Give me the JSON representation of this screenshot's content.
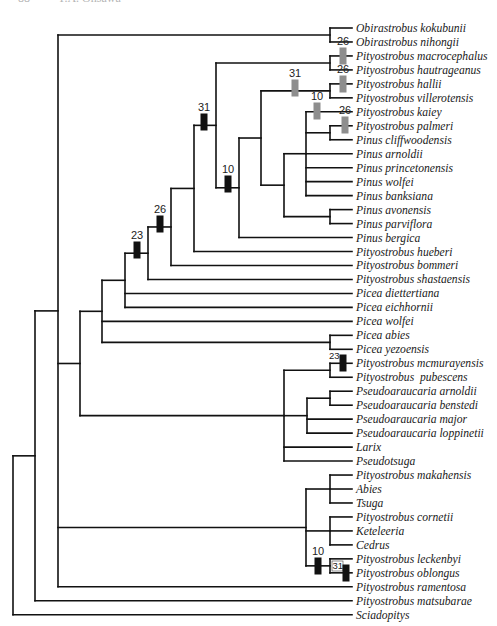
{
  "header": {
    "page_number": "88",
    "author": "T.A. Ohsawa"
  },
  "colors": {
    "line": "#111111",
    "black_bar": "#111111",
    "gray_bar": "#8e8e8e",
    "label": "#1a1a1a"
  },
  "tree": {
    "row_start_y": 28,
    "row_step": 13.97,
    "leaf_x": 352,
    "label_x": 356,
    "leaves": [
      "Obirastrobus kokubunii",
      "Obirastrobus nihongii",
      "Pityostrobus macrocephalus",
      "Pityostrobus hautrageanus",
      "Pityostrobus hallii",
      "Pityostrobus villerotensis",
      "Pityostrobus kaiey",
      "Pityostrobus palmeri",
      "Pinus cliffwoodensis",
      "Pinus arnoldii",
      "Pinus princetonensis",
      "Pinus wolfei",
      "Pinus banksiana",
      "Pinus avonensis",
      "Pinus parviflora",
      "Pinus bergica",
      "Pityostrobus hueberi",
      "Pityostrobus bommeri",
      "Pityostrobus shastaensis",
      "Picea diettertiana",
      "Picea eichhornii",
      "Picea wolfei",
      "Picea abies",
      "Picea yezoensis",
      "Pityostrobus mcmurayensis",
      "Pityostrobus  pubescens",
      "Pseudoaraucaria arnoldii",
      "Pseudoaraucaria benstedi",
      "Pseudoaraucaria major",
      "Pseudoaraucaria loppinetii",
      "Larix",
      "Pseudotsuga",
      "Pityostrobus makahensis",
      "Abies",
      "Tsuga",
      "Pityostrobus cornetii",
      "Keteleeria",
      "Cedrus",
      "Pityostrobus leckenbyi",
      "Pityostrobus oblongus",
      "Pityostrobus ramentosa",
      "Pityostrobus matsubarae",
      "Sciadopitys"
    ],
    "nodes": [
      {
        "id": "root",
        "x": 13,
        "children": [
          "n35",
          "L42"
        ]
      },
      {
        "id": "n35",
        "x": 35,
        "children": [
          "n58",
          "L41"
        ]
      },
      {
        "id": "n58",
        "x": 58,
        "children": [
          "nObi",
          "n80",
          "nBot",
          "L40"
        ]
      },
      {
        "id": "nObi",
        "x": 330,
        "children": [
          "L0",
          "L1"
        ]
      },
      {
        "id": "n80",
        "x": 80,
        "children": [
          "n102",
          "nPse"
        ]
      },
      {
        "id": "n102",
        "x": 102,
        "children": [
          "n125",
          "L21",
          "nPab"
        ]
      },
      {
        "id": "nPab",
        "x": 330,
        "children": [
          "L22",
          "L23"
        ]
      },
      {
        "id": "n125",
        "x": 125,
        "children": [
          "n148",
          "L19",
          "L20"
        ]
      },
      {
        "id": "n148",
        "x": 148,
        "children": [
          "n171",
          "L18"
        ]
      },
      {
        "id": "n171",
        "x": 171,
        "children": [
          "n194",
          "L17"
        ]
      },
      {
        "id": "n194",
        "x": 194,
        "children": [
          "n216",
          "L16"
        ]
      },
      {
        "id": "n216",
        "x": 216,
        "children": [
          "nMac",
          "n239"
        ]
      },
      {
        "id": "nMac",
        "x": 330,
        "children": [
          "L2",
          "L3"
        ]
      },
      {
        "id": "n239",
        "x": 239,
        "children": [
          "n261",
          "L15"
        ]
      },
      {
        "id": "n261",
        "x": 261,
        "children": [
          "nHal",
          "n284"
        ]
      },
      {
        "id": "nHal",
        "x": 330,
        "children": [
          "L4",
          "L5"
        ]
      },
      {
        "id": "n284",
        "x": 284,
        "children": [
          "n306",
          "nAvo"
        ]
      },
      {
        "id": "n306",
        "x": 306,
        "children": [
          "L6",
          "nPal",
          "L9",
          "L10",
          "L11",
          "L12"
        ]
      },
      {
        "id": "nPal",
        "x": 330,
        "children": [
          "L7",
          "L8"
        ]
      },
      {
        "id": "nAvo",
        "x": 330,
        "children": [
          "L13",
          "L14"
        ]
      },
      {
        "id": "nPse",
        "x": 284,
        "children": [
          "nMcm",
          "nPar",
          "L30",
          "L31"
        ]
      },
      {
        "id": "nMcm",
        "x": 330,
        "children": [
          "L24",
          "L25"
        ]
      },
      {
        "id": "nPar",
        "x": 307,
        "children": [
          "nArn",
          "L28",
          "L29"
        ]
      },
      {
        "id": "nArn",
        "x": 330,
        "children": [
          "L26",
          "L27"
        ]
      },
      {
        "id": "nBot",
        "x": 306,
        "children": [
          "nMak",
          "nCor",
          "nLec"
        ]
      },
      {
        "id": "nMak",
        "x": 330,
        "children": [
          "L32",
          "L33",
          "L34"
        ]
      },
      {
        "id": "nCor",
        "x": 330,
        "children": [
          "L35",
          "L36",
          "L37"
        ]
      },
      {
        "id": "nLec",
        "x": 330,
        "children": [
          "L38",
          "L39"
        ]
      }
    ],
    "bars": [
      {
        "label": "31",
        "x": 204,
        "y": 122,
        "color": "black"
      },
      {
        "label": "10",
        "x": 228,
        "y": 184,
        "color": "black"
      },
      {
        "label": "26",
        "x": 160,
        "y": 224,
        "color": "black"
      },
      {
        "label": "23",
        "x": 137,
        "y": 250,
        "color": "black"
      },
      {
        "label": "31",
        "x": 295,
        "y": 88,
        "color": "gray"
      },
      {
        "label": "26",
        "x": 343,
        "y": 56,
        "color": "gray"
      },
      {
        "label": "26",
        "x": 343,
        "y": 84,
        "color": "gray"
      },
      {
        "label": "10",
        "x": 317,
        "y": 111,
        "color": "gray"
      },
      {
        "label": "26",
        "x": 345,
        "y": 125,
        "color": "gray"
      },
      {
        "label": "23",
        "x": 343,
        "y": 363,
        "color": "black",
        "small": true
      },
      {
        "label": "10",
        "x": 318,
        "y": 566,
        "color": "black"
      },
      {
        "label": "31",
        "x": 346,
        "y": 573,
        "color": "black",
        "small": true,
        "boxed": true
      }
    ]
  }
}
